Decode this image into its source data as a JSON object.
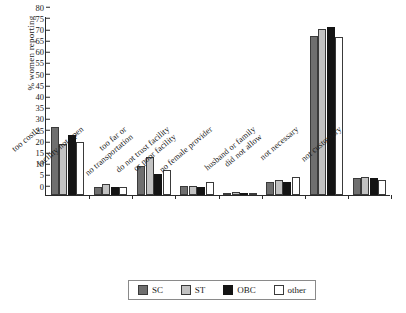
{
  "chart_data": {
    "type": "bar",
    "title": "",
    "xlabel": "",
    "ylabel": "% women reporting",
    "ylim": [
      0,
      80
    ],
    "ytick_step": 5,
    "grid": false,
    "legend_position": "bottom",
    "yticks": [
      "0",
      "5",
      "10",
      "15",
      "20",
      "25",
      "30",
      "35",
      "40",
      "45",
      "50",
      "55",
      "60",
      "65",
      "70",
      "75",
      "80"
    ],
    "categories": [
      "too costly",
      "facility not open",
      "too far or\nno transportation",
      "do not trust facility\nor poor facility",
      "no female provider",
      "husband or family\ndid not allow",
      "not necessary",
      "not customary"
    ],
    "series": [
      {
        "name": "SC",
        "color": "#6f6f6f",
        "values": [
          30.5,
          3.6,
          13.0,
          4.0,
          1.0,
          6.0,
          71.0,
          7.5
        ]
      },
      {
        "name": "ST",
        "color": "#c2c2c2",
        "values": [
          23.0,
          4.8,
          17.0,
          4.2,
          1.3,
          6.5,
          74.0,
          8.0
        ]
      },
      {
        "name": "OBC",
        "color": "#141414",
        "values": [
          27.0,
          3.4,
          9.5,
          3.5,
          1.0,
          6.0,
          75.0,
          7.5
        ]
      },
      {
        "name": "other",
        "color": "#ffffff",
        "values": [
          23.5,
          3.6,
          11.0,
          6.0,
          0.8,
          8.0,
          70.5,
          6.5
        ]
      }
    ],
    "legend": [
      {
        "label": "SC",
        "key": "sc"
      },
      {
        "label": "ST",
        "key": "st"
      },
      {
        "label": "OBC",
        "key": "obc"
      },
      {
        "label": "other",
        "key": "other"
      }
    ]
  }
}
